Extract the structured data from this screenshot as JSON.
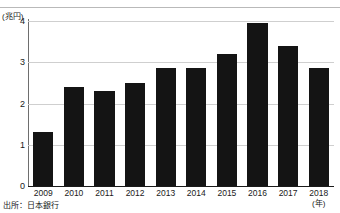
{
  "chart_data": {
    "type": "bar",
    "title": "",
    "subtitle": "",
    "xlabel": "(年)",
    "ylabel": "(兆円)",
    "unit_label": "(兆円)",
    "categories": [
      "2009",
      "2010",
      "2011",
      "2012",
      "2013",
      "2014",
      "2015",
      "2016",
      "2017",
      "2018"
    ],
    "values": [
      1.3,
      2.4,
      2.3,
      2.5,
      2.85,
      2.85,
      3.2,
      3.95,
      3.4,
      2.85
    ],
    "series": [
      {
        "name": "",
        "values": [
          1.3,
          2.4,
          2.3,
          2.5,
          2.85,
          2.85,
          3.2,
          3.95,
          3.4,
          2.85
        ]
      }
    ],
    "ylim": [
      0,
      4
    ],
    "yticks": [
      "0",
      "1",
      "2",
      "3",
      "4"
    ],
    "ytick_values": [
      0,
      1,
      2,
      3,
      4
    ],
    "grid": true,
    "legend": null,
    "legend_position": "none",
    "bar_color": "#141414",
    "grid_color": "#cfcfcf",
    "axis_color": "#1a1a1a"
  },
  "footer": {
    "source_note": "出所：日本銀行"
  },
  "axes": {
    "y_unit": "(兆円)",
    "x_unit": "(年)"
  }
}
